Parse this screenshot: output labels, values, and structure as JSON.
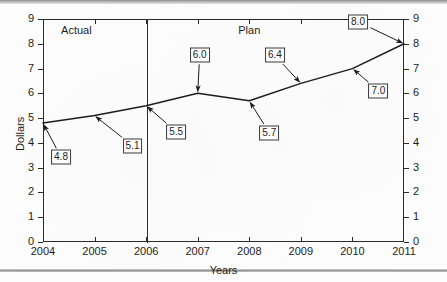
{
  "chart_data": {
    "type": "line",
    "title": "",
    "xlabel": "Years",
    "ylabel": "Dollars",
    "x": [
      2004,
      2005,
      2006,
      2007,
      2008,
      2009,
      2010,
      2011
    ],
    "values": [
      4.8,
      5.1,
      5.5,
      6.0,
      5.7,
      6.4,
      7.0,
      8.0
    ],
    "point_labels": [
      "4.8",
      "5.1",
      "5.5",
      "6.0",
      "5.7",
      "6.4",
      "7.0",
      "8.0"
    ],
    "xlim": [
      2004,
      2011
    ],
    "ylim": [
      0,
      9
    ],
    "x_ticks": [
      "2004",
      "2005",
      "2006",
      "2007",
      "2008",
      "2009",
      "2010",
      "2011"
    ],
    "y_ticks_left": [
      "9",
      "8",
      "7",
      "6",
      "5",
      "4",
      "3",
      "2",
      "1",
      "0"
    ],
    "y_ticks_right": [
      "9",
      "8",
      "7",
      "6",
      "5",
      "4",
      "3",
      "2",
      "1",
      "0"
    ],
    "grid": false,
    "legend": "none",
    "annotations": [
      {
        "name": "actual-region",
        "text": "Actual",
        "x": 2004.35,
        "y": 8.55
      },
      {
        "name": "plan-region",
        "text": "Plan",
        "x": 2008.0,
        "y": 8.55
      }
    ],
    "divider": {
      "x": 2006,
      "label": "actual-plan-divider"
    },
    "series_color": "#1d1d1d"
  },
  "axes": {
    "x_title": "Years",
    "y_title": "Dollars"
  },
  "regions": {
    "actual": "Actual",
    "plan": "Plan"
  }
}
